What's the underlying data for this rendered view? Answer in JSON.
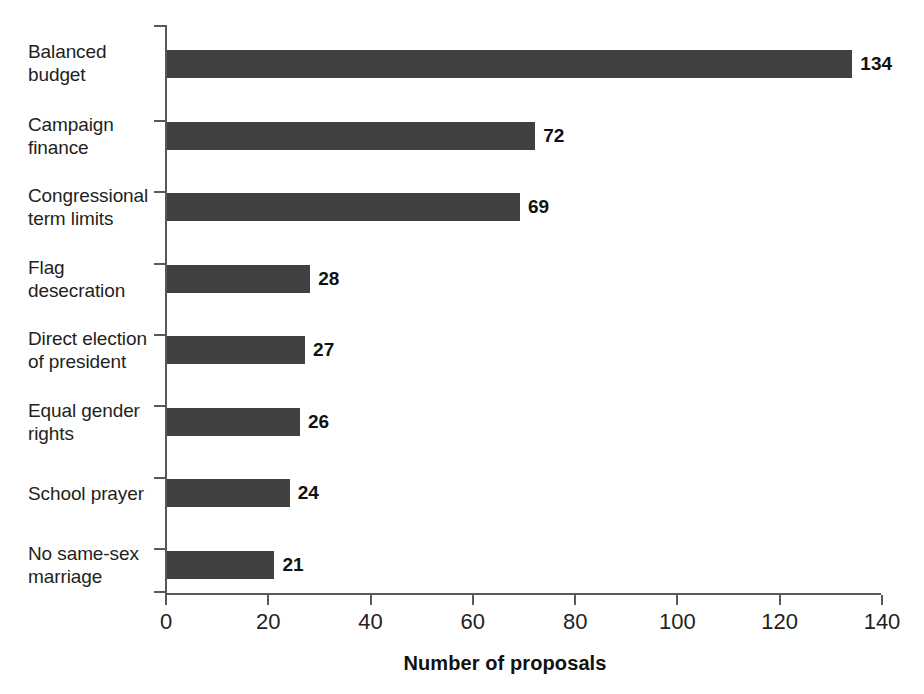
{
  "chart_data": {
    "type": "bar",
    "orientation": "horizontal",
    "title": "",
    "subtitle": "",
    "xlabel": "Number of proposals",
    "ylabel": "",
    "xlim": [
      0,
      140
    ],
    "ylim": null,
    "grid": false,
    "legend": null,
    "bar_color": "#414141",
    "axis_color": "#58595b",
    "background_color": "#ffffff",
    "value_labels_shown": true,
    "xticks": [
      0,
      20,
      40,
      60,
      80,
      100,
      120,
      140
    ],
    "xtick_labels": [
      "0",
      "20",
      "40",
      "60",
      "80",
      "100",
      "120",
      "140"
    ],
    "categories": [
      "Balanced\nbudget",
      "Campaign\nfinance",
      "Congressional\nterm limits",
      "Flag\ndesecration",
      "Direct election\nof president",
      "Equal gender\nrights",
      "School prayer",
      "No same-sex\nmarriage"
    ],
    "values": [
      134,
      72,
      69,
      28,
      27,
      26,
      24,
      21
    ],
    "value_label_texts": [
      "134",
      "72",
      "69",
      "28",
      "27",
      "26",
      "24",
      "21"
    ],
    "annotations": []
  }
}
